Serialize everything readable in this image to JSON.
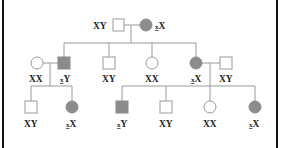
{
  "diagram": {
    "type": "pedigree",
    "colors": {
      "affected_fill": "#8c8c8c",
      "unaffected_fill": "#ffffff",
      "line": "#9a9a9a",
      "border": "#111111"
    },
    "generations": [
      {
        "level": 1,
        "individuals": [
          {
            "id": "g1-father",
            "sex": "male",
            "affected": false,
            "genotype": "XY",
            "mark": ""
          },
          {
            "id": "g1-mother",
            "sex": "female",
            "affected": true,
            "genotype": "X",
            "mark": "x"
          }
        ]
      },
      {
        "level": 2,
        "individuals": [
          {
            "id": "g2-spouse-1",
            "sex": "female",
            "affected": false,
            "genotype": "XX",
            "mark": ""
          },
          {
            "id": "g2-son-1",
            "sex": "male",
            "affected": true,
            "genotype": "Y",
            "mark": "x"
          },
          {
            "id": "g2-son-2",
            "sex": "male",
            "affected": false,
            "genotype": "XY",
            "mark": ""
          },
          {
            "id": "g2-daughter-1",
            "sex": "female",
            "affected": false,
            "genotype": "XX",
            "mark": ""
          },
          {
            "id": "g2-daughter-2",
            "sex": "female",
            "affected": true,
            "genotype": "X",
            "mark": "x"
          },
          {
            "id": "g2-spouse-2",
            "sex": "male",
            "affected": false,
            "genotype": "XY",
            "mark": ""
          }
        ]
      },
      {
        "level": 3,
        "individuals": [
          {
            "id": "g3-a-son",
            "sex": "male",
            "affected": false,
            "genotype": "XY",
            "mark": ""
          },
          {
            "id": "g3-a-daughter",
            "sex": "female",
            "affected": true,
            "genotype": "X",
            "mark": "x"
          },
          {
            "id": "g3-b-son-1",
            "sex": "male",
            "affected": true,
            "genotype": "Y",
            "mark": "x"
          },
          {
            "id": "g3-b-son-2",
            "sex": "male",
            "affected": false,
            "genotype": "XY",
            "mark": ""
          },
          {
            "id": "g3-b-daughter-1",
            "sex": "female",
            "affected": false,
            "genotype": "XX",
            "mark": ""
          },
          {
            "id": "g3-b-daughter-2",
            "sex": "female",
            "affected": true,
            "genotype": "X",
            "mark": "x"
          }
        ]
      }
    ],
    "labels": {
      "g1_father": "XY",
      "g1_mother_mark": "x",
      "g1_mother_rest": "X",
      "g2_spouse1": "XX",
      "g2_son1_mark": "x",
      "g2_son1_rest": "Y",
      "g2_son2": "XY",
      "g2_daughter1": "XX",
      "g2_daughter2_mark": "x",
      "g2_daughter2_rest": "X",
      "g2_spouse2": "XY",
      "g3_a_son": "XY",
      "g3_a_daughter_mark": "x",
      "g3_a_daughter_rest": "X",
      "g3_b_son1_mark": "x",
      "g3_b_son1_rest": "Y",
      "g3_b_son2": "XY",
      "g3_b_daughter1": "XX",
      "g3_b_daughter2_mark": "x",
      "g3_b_daughter2_rest": "X"
    }
  }
}
